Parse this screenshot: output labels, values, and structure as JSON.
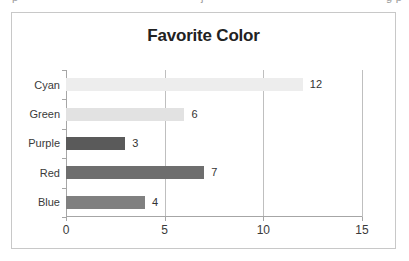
{
  "clipped_header": {
    "left_fragment": "p",
    "mid_fragment": "j",
    "right_fragment": "g  p"
  },
  "chart_data": {
    "type": "bar",
    "orientation": "horizontal",
    "title": "Favorite Color",
    "xlabel": "",
    "ylabel": "",
    "categories": [
      "Cyan",
      "Green",
      "Purple",
      "Red",
      "Blue"
    ],
    "values": [
      12,
      6,
      3,
      7,
      4
    ],
    "value_labels": [
      "12",
      "6",
      "3",
      "7",
      "4"
    ],
    "bar_colors": [
      "#ededed",
      "#e2e2e2",
      "#5a5a5a",
      "#6e6e6e",
      "#808080"
    ],
    "xlim": [
      0,
      15
    ],
    "xticks": [
      0,
      5,
      10,
      15
    ],
    "xtick_labels": [
      "0",
      "5",
      "10",
      "15"
    ],
    "grid": true,
    "gridline_values": [
      0,
      5,
      10,
      15
    ],
    "legend": null,
    "legend_position": "none",
    "show_data_labels": true,
    "frame_border_color": "#c8c8c8",
    "axis_color": "#a6a6a6",
    "gridline_color": "#bfbfbf",
    "title_color": "#222222",
    "label_color": "#3a3a3a",
    "background": "#ffffff"
  }
}
